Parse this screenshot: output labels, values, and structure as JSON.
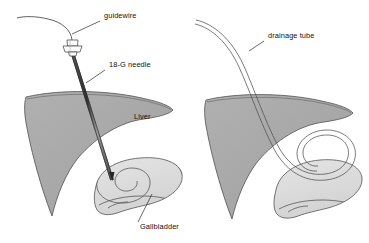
{
  "figure": {
    "panels": [
      {
        "id": "panel-left",
        "name": "needle-and-guidewire-panel",
        "labels": [
          {
            "key": "guidewire",
            "text": "guidewire",
            "x": 104,
            "y": 18
          },
          {
            "key": "needle",
            "text": "18-G needle",
            "x": 109,
            "y": 67
          },
          {
            "key": "liver",
            "text": "Liver",
            "x": 134,
            "y": 119
          },
          {
            "key": "gallbladder",
            "text": "Gallbladder",
            "x": 140,
            "y": 229
          }
        ]
      },
      {
        "id": "panel-right",
        "name": "drainage-tube-panel",
        "labels": [
          {
            "key": "drainage_tube",
            "text": "drainage tube",
            "x": 268,
            "y": 38
          }
        ]
      }
    ],
    "colors": {
      "background": "#ffffff",
      "liver_fill": "#a9a9a9",
      "liver_fill_shade": "#9d9d9d",
      "liver_outline": "#4a4a4a",
      "gallbladder_fill": "#dddddd",
      "gallbladder_outline": "#4a4a4a",
      "needle_dark": "#3c3c3c",
      "needle_light": "#8e8e8e",
      "tube_stroke": "#4f4f4f",
      "leader_stroke": "#2a2a2a",
      "label_text": "#101010"
    },
    "structures": [
      {
        "name": "guidewire",
        "panel": "panel-left",
        "description": "curved wire exiting needle hub toward upper left"
      },
      {
        "name": "needle-hub",
        "panel": "panel-left",
        "description": "luer fitting at needle base"
      },
      {
        "name": "18-g-needle-shaft",
        "panel": "panel-left",
        "description": "straight shaft traversing liver into gallbladder"
      },
      {
        "name": "liver",
        "panel": "panel-left",
        "description": "wedge shaped gray organ"
      },
      {
        "name": "gallbladder",
        "panel": "panel-left",
        "description": "pear shaped light organ with spiral cystic duct"
      },
      {
        "name": "drainage-tube",
        "panel": "panel-right",
        "description": "hollow tube curving into coiled pigtail inside gallbladder"
      },
      {
        "name": "liver",
        "panel": "panel-right",
        "description": "wedge shaped gray organ"
      },
      {
        "name": "gallbladder",
        "panel": "panel-right",
        "description": "pear shaped light organ containing pigtail coil"
      }
    ]
  }
}
